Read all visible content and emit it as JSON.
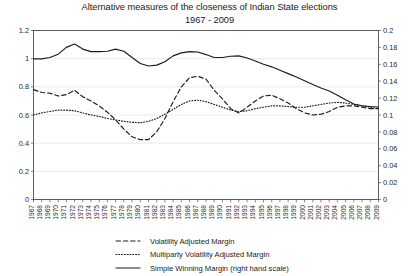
{
  "chart_data": {
    "type": "line",
    "title": "Alternative measures of the closeness of Indian State elections",
    "subtitle": "1967 - 2009",
    "xlabel": "",
    "ylabel": "",
    "grid": true,
    "legend_position": "bottom",
    "x": [
      1967,
      1968,
      1969,
      1970,
      1971,
      1972,
      1973,
      1974,
      1975,
      1976,
      1977,
      1978,
      1979,
      1980,
      1981,
      1982,
      1983,
      1984,
      1985,
      1986,
      1987,
      1988,
      1989,
      1990,
      1991,
      1992,
      1993,
      1994,
      1995,
      1996,
      1997,
      1998,
      1999,
      2000,
      2001,
      2002,
      2003,
      2004,
      2005,
      2006,
      2007,
      2008,
      2009
    ],
    "xtick_labels": [
      "1967",
      "1968",
      "1969",
      "1970",
      "1971",
      "1972",
      "1973",
      "1974",
      "1975",
      "1976",
      "1977",
      "1978",
      "1979",
      "1980",
      "1981",
      "1982",
      "1983",
      "1984",
      "1985",
      "1986",
      "1987",
      "1988",
      "1989",
      "1990",
      "1991",
      "1992",
      "1993",
      "1994",
      "1995",
      "1996",
      "1997",
      "1998",
      "1999",
      "2000",
      "2001",
      "2002",
      "2003",
      "2004",
      "2005",
      "2006",
      "2007",
      "2008",
      "2009"
    ],
    "ylim": [
      0,
      1.2
    ],
    "ytick_labels": [
      "0",
      "0.2",
      "0.4",
      "0.6",
      "0.8",
      "1",
      "1.2"
    ],
    "ytick_values": [
      0,
      0.2,
      0.4,
      0.6,
      0.8,
      1,
      1.2
    ],
    "y2lim": [
      0,
      0.2
    ],
    "y2tick_labels": [
      "0",
      "0.02",
      "0.04",
      "0.06",
      "0.08",
      "0.1",
      "0.12",
      "0.14",
      "0.16",
      "0.18",
      "0.2"
    ],
    "y2tick_values": [
      0,
      0.02,
      0.04,
      0.06,
      0.08,
      0.1,
      0.12,
      0.14,
      0.16,
      0.18,
      0.2
    ],
    "series": [
      {
        "name": "Volatility Adjusted Margin",
        "style": "dashed",
        "axis": "left",
        "color": "#1c1c1c",
        "values": [
          0.78,
          0.76,
          0.755,
          0.735,
          0.745,
          0.775,
          0.73,
          0.7,
          0.665,
          0.62,
          0.565,
          0.5,
          0.445,
          0.425,
          0.425,
          0.48,
          0.575,
          0.695,
          0.8,
          0.865,
          0.875,
          0.855,
          0.775,
          0.715,
          0.645,
          0.615,
          0.655,
          0.7,
          0.735,
          0.74,
          0.715,
          0.685,
          0.645,
          0.615,
          0.6,
          0.605,
          0.625,
          0.655,
          0.665,
          0.665,
          0.655,
          0.645,
          0.645
        ]
      },
      {
        "name": "Multiparty Volatility Adjusted Margin",
        "style": "dotted",
        "axis": "left",
        "color": "#1c1c1c",
        "values": [
          0.6,
          0.615,
          0.625,
          0.635,
          0.635,
          0.63,
          0.615,
          0.6,
          0.59,
          0.575,
          0.565,
          0.555,
          0.548,
          0.545,
          0.555,
          0.575,
          0.605,
          0.64,
          0.675,
          0.7,
          0.705,
          0.695,
          0.675,
          0.655,
          0.635,
          0.625,
          0.63,
          0.645,
          0.655,
          0.665,
          0.665,
          0.66,
          0.655,
          0.655,
          0.665,
          0.675,
          0.685,
          0.69,
          0.685,
          0.675,
          0.665,
          0.655,
          0.645
        ]
      },
      {
        "name": "Simple Winning Margin (right hand scale)",
        "style": "solid",
        "axis": "right",
        "color": "#1c1c1c",
        "values": [
          0.1665,
          0.1665,
          0.168,
          0.172,
          0.18,
          0.184,
          0.178,
          0.175,
          0.175,
          0.1755,
          0.178,
          0.1755,
          0.168,
          0.161,
          0.158,
          0.159,
          0.163,
          0.17,
          0.1735,
          0.175,
          0.1745,
          0.1715,
          0.168,
          0.168,
          0.1695,
          0.17,
          0.1675,
          0.164,
          0.16,
          0.157,
          0.153,
          0.149,
          0.145,
          0.1405,
          0.136,
          0.132,
          0.1285,
          0.1235,
          0.118,
          0.113,
          0.111,
          0.11,
          0.1095
        ]
      }
    ]
  },
  "legend": {
    "items": [
      {
        "label": "Volatility Adjusted Margin",
        "style": "dashed"
      },
      {
        "label": "Multiparty Volatility Adjusted Margin",
        "style": "dotted"
      },
      {
        "label": "Simple Winning Margin (right hand scale)",
        "style": "solid"
      }
    ]
  }
}
